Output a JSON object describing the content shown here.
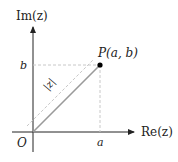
{
  "diagram": {
    "axes": {
      "x_label": "Re(z)",
      "y_label": "Im(z)",
      "origin_label": "O"
    },
    "point": {
      "label": "P(a, b)",
      "x_label": "a",
      "y_label": "b"
    },
    "segment_label": "|z|",
    "colors": {
      "axis": "#222222",
      "segment": "#9a9a9a",
      "guide": "#c8c8c8",
      "point": "#000000"
    }
  }
}
